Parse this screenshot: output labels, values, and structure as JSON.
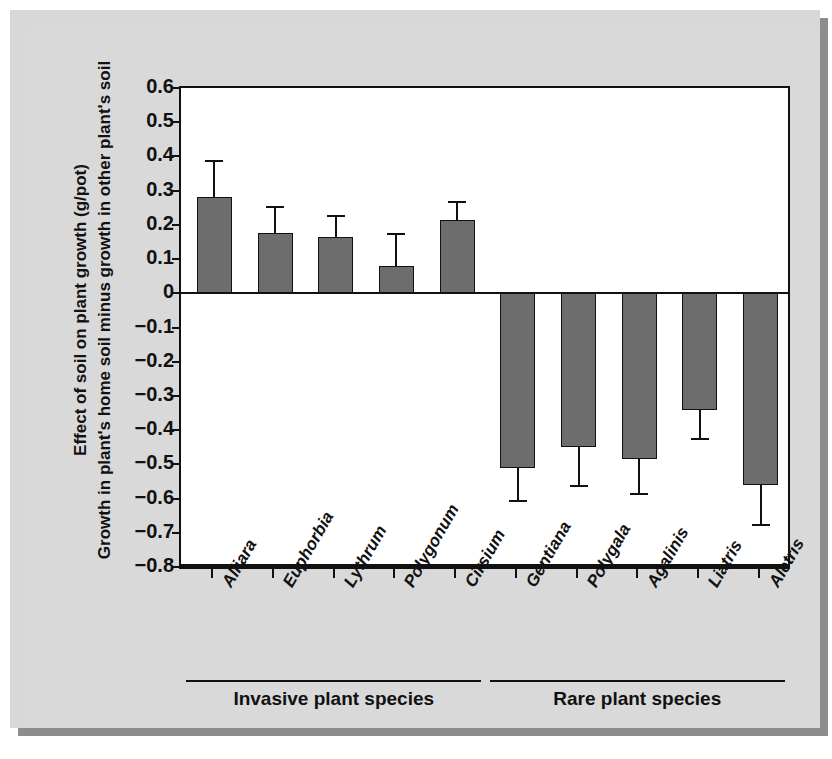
{
  "chart_data": {
    "type": "bar",
    "title": "",
    "xlabel": "",
    "ylabel_line1": "Effect of soil on plant growth (g/pot)",
    "ylabel_line2": "Growth in plant's home soil minus growth in other plant's soil",
    "ylim": [
      -0.8,
      0.6
    ],
    "ytick_labels": [
      "0.6",
      "0.5",
      "0.4",
      "0.3",
      "0.2",
      "0.1",
      "0",
      "−0.1",
      "−0.2",
      "−0.3",
      "−0.4",
      "−0.5",
      "−0.6",
      "−0.7",
      "−0.8"
    ],
    "ytick_values": [
      0.6,
      0.5,
      0.4,
      0.3,
      0.2,
      0.1,
      0,
      -0.1,
      -0.2,
      -0.3,
      -0.4,
      -0.5,
      -0.6,
      -0.7,
      -0.8
    ],
    "grid": false,
    "legend": false,
    "categories": [
      "Alliara",
      "Euphorbia",
      "Lythrum",
      "Polygonum",
      "Cirsium",
      "Gentiana",
      "Polygala",
      "Agalinis",
      "Liatris",
      "Aletris"
    ],
    "values": [
      0.28,
      0.175,
      0.165,
      0.08,
      0.215,
      -0.51,
      -0.45,
      -0.485,
      -0.34,
      -0.56
    ],
    "error_upper": [
      0.39,
      0.255,
      0.23,
      0.175,
      0.27,
      null,
      null,
      null,
      null,
      null
    ],
    "error_lower": [
      null,
      null,
      null,
      null,
      null,
      -0.61,
      -0.565,
      -0.59,
      -0.43,
      -0.68
    ],
    "bar_color": "#6d6d6d",
    "bar_edge_color": "#111111",
    "groups": [
      {
        "label": "Invasive plant species",
        "members": [
          "Alliara",
          "Euphorbia",
          "Lythrum",
          "Polygonum",
          "Cirsium"
        ]
      },
      {
        "label": "Rare plant species",
        "members": [
          "Gentiana",
          "Polygala",
          "Agalinis",
          "Liatris",
          "Aletris"
        ]
      }
    ]
  },
  "figure": {
    "background_color": "#d9d9d9",
    "plot_background_color": "#ffffff"
  }
}
